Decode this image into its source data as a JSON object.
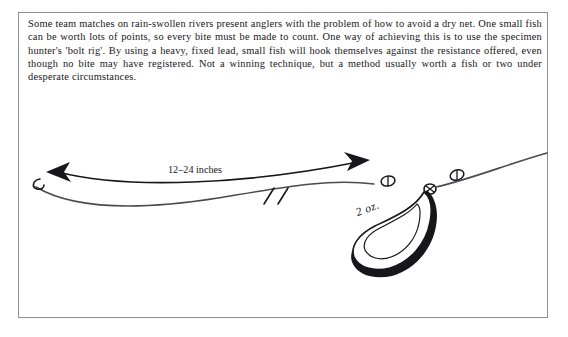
{
  "page": {
    "background_color": "#ffffff",
    "border_color": "#8e8e90"
  },
  "caption": {
    "text": "Some team matches on rain-swollen rivers present anglers with the problem of how to avoid a dry net. One small fish can be worth lots of points, so every bite must be made to count. One way of achieving this is to use the specimen hunter's 'bolt rig'. By using a heavy, fixed lead, small fish will hook themselves against the resistance offered, even though no bite may have registered. Not a winning technique, but a method usually worth a fish or two under desperate circumstances."
  },
  "diagram": {
    "ink_color": "#17171b",
    "line_color": "#4a4a50",
    "labels": {
      "hooklength": "12–24 inches",
      "lead_weight": "2 oz."
    },
    "parts": [
      "hook",
      "hooklength-line",
      "measurement-arrow",
      "break-marks",
      "bead-upper",
      "bead-lower",
      "swivel-junction",
      "lead-weight",
      "mainline"
    ]
  }
}
